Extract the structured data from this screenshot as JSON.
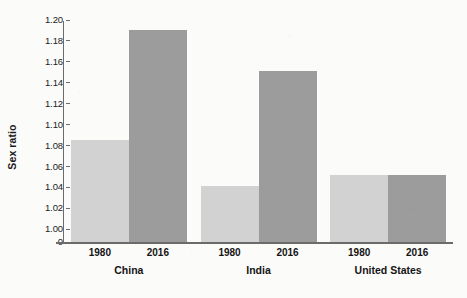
{
  "chart_data": {
    "type": "bar",
    "title": "",
    "xlabel": "",
    "ylabel": "Sex ratio",
    "categories": [
      "China",
      "India",
      "United States"
    ],
    "series": [
      {
        "name": "1980",
        "values": [
          1.085,
          1.041,
          1.052
        ],
        "color": "#d2d2d2"
      },
      {
        "name": "2016",
        "values": [
          1.19,
          1.151,
          1.052
        ],
        "color": "#9c9c9c"
      }
    ],
    "ylim": [
      1.0,
      1.2
    ],
    "y_axis_break": true,
    "y_ticks": [
      "0",
      "1.00",
      "1.02",
      "1.04",
      "1.06",
      "1.08",
      "1.10",
      "1.12",
      "1.14",
      "1.16",
      "1.18",
      "1.20"
    ],
    "y_tick_values": [
      0,
      1.0,
      1.02,
      1.04,
      1.06,
      1.08,
      1.1,
      1.12,
      1.14,
      1.16,
      1.18,
      1.2
    ],
    "grid": false,
    "legend": null,
    "legend_position": "none",
    "bar_labels": [
      {
        "group": "China",
        "year": "1980",
        "value": 1.085
      },
      {
        "group": "China",
        "year": "2016",
        "value": 1.19
      },
      {
        "group": "India",
        "year": "1980",
        "value": 1.041
      },
      {
        "group": "India",
        "year": "2016",
        "value": 1.151
      },
      {
        "group": "United States",
        "year": "1980",
        "value": 1.052
      },
      {
        "group": "United States",
        "year": "2016",
        "value": 1.052
      }
    ],
    "axis_color": "#6b6b6b",
    "background_color": "#fbfbfa",
    "text_color": "#141414"
  }
}
